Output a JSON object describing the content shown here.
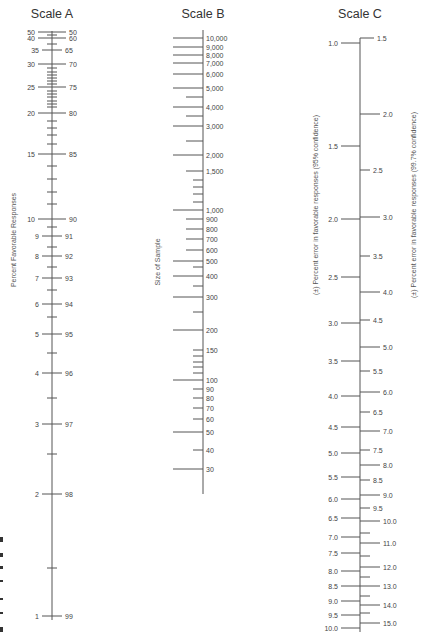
{
  "scale_a": {
    "title": "Scale A",
    "axis_title": "Percent Favorable Responses",
    "axis_x": 52,
    "y_top": 31,
    "y_bottom": 620,
    "major_ticks": [
      {
        "y": 32,
        "left": "50",
        "right": "50"
      },
      {
        "y": 38,
        "left": "40",
        "right": "60"
      },
      {
        "y": 50,
        "left": "35",
        "right": "65",
        "short": true
      },
      {
        "y": 64,
        "left": "30",
        "right": "70"
      },
      {
        "y": 87,
        "left": "25",
        "right": "75"
      },
      {
        "y": 113,
        "left": "20",
        "right": "80"
      },
      {
        "y": 154,
        "left": "15",
        "right": "85"
      },
      {
        "y": 219,
        "left": "10",
        "right": "90"
      },
      {
        "y": 236,
        "left": "9",
        "right": "91",
        "short": true
      },
      {
        "y": 256,
        "left": "8",
        "right": "92",
        "short": true
      },
      {
        "y": 278,
        "left": "7",
        "right": "93",
        "short": true
      },
      {
        "y": 304,
        "left": "6",
        "right": "94",
        "short": true
      },
      {
        "y": 334,
        "left": "5",
        "right": "95",
        "short": true
      },
      {
        "y": 373,
        "left": "4",
        "right": "96",
        "short": true
      },
      {
        "y": 424,
        "left": "3",
        "right": "97",
        "short": true
      },
      {
        "y": 494,
        "left": "2",
        "right": "98",
        "short": true
      },
      {
        "y": 616,
        "left": "1",
        "right": "99",
        "short": true
      }
    ],
    "minor_ticks": [
      35,
      44,
      68,
      72,
      75,
      78,
      81,
      84,
      91,
      94,
      97,
      101,
      104,
      107,
      121,
      128,
      135,
      144,
      166,
      179,
      192,
      204,
      227,
      247,
      267,
      290,
      317,
      353,
      398,
      454,
      568
    ]
  },
  "scale_b": {
    "title": "Scale B",
    "axis_title": "Size of Sample",
    "axis_x": 203,
    "y_top": 30,
    "y_bottom": 494,
    "labeled_ticks": [
      {
        "y": 38,
        "label": "10,000",
        "len": 30
      },
      {
        "y": 47,
        "label": "9,000",
        "len": 30
      },
      {
        "y": 55,
        "label": "8,000",
        "len": 30
      },
      {
        "y": 63,
        "label": "7,000",
        "len": 30
      },
      {
        "y": 74,
        "label": "6,000",
        "len": 30
      },
      {
        "y": 88,
        "label": "5,000",
        "len": 30
      },
      {
        "y": 107,
        "label": "4,000",
        "len": 30
      },
      {
        "y": 126,
        "label": "3,000",
        "len": 30
      },
      {
        "y": 155,
        "label": "2,000",
        "len": 30
      },
      {
        "y": 171,
        "label": "1,500",
        "len": 17
      },
      {
        "y": 210,
        "label": "1,000",
        "len": 30
      },
      {
        "y": 219,
        "label": "900",
        "len": 17
      },
      {
        "y": 229,
        "label": "800",
        "len": 17
      },
      {
        "y": 239,
        "label": "700",
        "len": 17
      },
      {
        "y": 250,
        "label": "600",
        "len": 17
      },
      {
        "y": 261,
        "label": "500",
        "len": 30
      },
      {
        "y": 276,
        "label": "400",
        "len": 30
      },
      {
        "y": 297,
        "label": "300",
        "len": 30
      },
      {
        "y": 330,
        "label": "200",
        "len": 30
      },
      {
        "y": 350,
        "label": "150",
        "len": 10
      },
      {
        "y": 380,
        "label": "100",
        "len": 30
      },
      {
        "y": 389,
        "label": "90",
        "len": 10
      },
      {
        "y": 398,
        "label": "80",
        "len": 10
      },
      {
        "y": 408,
        "label": "70",
        "len": 10
      },
      {
        "y": 419,
        "label": "60",
        "len": 10
      },
      {
        "y": 432,
        "label": "50",
        "len": 30
      },
      {
        "y": 450,
        "label": "40",
        "len": 10
      },
      {
        "y": 469,
        "label": "30",
        "len": 30
      }
    ],
    "minor_ticks": [
      {
        "y": 97,
        "len": 17
      },
      {
        "y": 116,
        "len": 17
      },
      {
        "y": 141,
        "len": 17
      },
      {
        "y": 180,
        "len": 10
      },
      {
        "y": 187,
        "len": 10
      },
      {
        "y": 194,
        "len": 10
      },
      {
        "y": 202,
        "len": 10
      },
      {
        "y": 267,
        "len": 10
      },
      {
        "y": 286,
        "len": 10
      },
      {
        "y": 312,
        "len": 10
      },
      {
        "y": 356,
        "len": 10
      },
      {
        "y": 362,
        "len": 10
      },
      {
        "y": 367,
        "len": 10
      },
      {
        "y": 373,
        "len": 10
      }
    ]
  },
  "scale_c": {
    "title": "Scale C",
    "axis_title_left": "(±) Percent error in favorable responses (95% confidence)",
    "axis_title_right": "(±) Percent error in favorable responses (99.7% confidence)",
    "axis_x": 360,
    "y_top": 38,
    "y_bottom": 632,
    "left_ticks": [
      {
        "y": 43,
        "label": "1.0"
      },
      {
        "y": 146,
        "label": "1.5"
      },
      {
        "y": 219,
        "label": "2.0"
      },
      {
        "y": 277,
        "label": "2.5"
      },
      {
        "y": 323,
        "label": "3.0"
      },
      {
        "y": 361,
        "label": "3.5"
      },
      {
        "y": 396,
        "label": "4.0"
      },
      {
        "y": 427,
        "label": "4.5"
      },
      {
        "y": 453,
        "label": "5.0"
      },
      {
        "y": 477,
        "label": "5.5"
      },
      {
        "y": 499,
        "label": "6.0"
      },
      {
        "y": 518,
        "label": "6.5"
      },
      {
        "y": 537,
        "label": "7.0"
      },
      {
        "y": 553,
        "label": "7.5"
      },
      {
        "y": 571,
        "label": "8.0"
      },
      {
        "y": 586,
        "label": "8.5"
      },
      {
        "y": 601,
        "label": "9.0"
      },
      {
        "y": 615,
        "label": "9.5"
      },
      {
        "y": 628,
        "label": "10.0"
      }
    ],
    "right_ticks": [
      {
        "y": 38,
        "label": "1.5",
        "len": 14
      },
      {
        "y": 114,
        "label": "2.0",
        "len": 20
      },
      {
        "y": 170,
        "label": "2.5",
        "len": 10
      },
      {
        "y": 217,
        "label": "3.0",
        "len": 20
      },
      {
        "y": 256,
        "label": "3.5",
        "len": 10
      },
      {
        "y": 292,
        "label": "4.0",
        "len": 20
      },
      {
        "y": 320,
        "label": "4.5",
        "len": 10
      },
      {
        "y": 347,
        "label": "5.0",
        "len": 20
      },
      {
        "y": 371,
        "label": "5.5",
        "len": 10
      },
      {
        "y": 392,
        "label": "6.0",
        "len": 20
      },
      {
        "y": 412,
        "label": "6.5",
        "len": 10
      },
      {
        "y": 431,
        "label": "7.0",
        "len": 20
      },
      {
        "y": 450,
        "label": "7.5",
        "len": 10
      },
      {
        "y": 465,
        "label": "8.0",
        "len": 20
      },
      {
        "y": 480,
        "label": "8.5",
        "len": 10
      },
      {
        "y": 495,
        "label": "9.0",
        "len": 20
      },
      {
        "y": 508,
        "label": "9.5",
        "len": 10
      },
      {
        "y": 521,
        "label": "10.0",
        "len": 20
      },
      {
        "y": 533,
        "label": "",
        "len": 10
      },
      {
        "y": 543,
        "label": "11.0",
        "len": 20
      },
      {
        "y": 556,
        "label": "",
        "len": 10
      },
      {
        "y": 567,
        "label": "12.0",
        "len": 20
      },
      {
        "y": 577,
        "label": "",
        "len": 10
      },
      {
        "y": 586,
        "label": "13.0",
        "len": 20
      },
      {
        "y": 596,
        "label": "",
        "len": 10
      },
      {
        "y": 605,
        "label": "14.0",
        "len": 20
      },
      {
        "y": 613,
        "label": "",
        "len": 10
      },
      {
        "y": 623,
        "label": "15.0",
        "len": 20
      }
    ]
  },
  "edge_marks": [
    {
      "y": 537,
      "h": 5
    },
    {
      "y": 553,
      "h": 4
    },
    {
      "y": 566,
      "h": 3
    },
    {
      "y": 580,
      "h": 2
    },
    {
      "y": 598,
      "h": 2
    },
    {
      "y": 612,
      "h": 2
    },
    {
      "y": 627,
      "h": 5
    }
  ]
}
